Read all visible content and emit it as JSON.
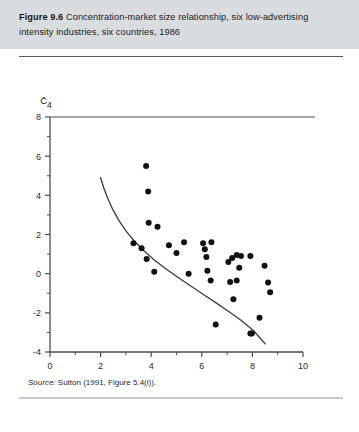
{
  "figure": {
    "label": "Figure 9.6",
    "title_text": "Concentration-market size relationship, six low-advertising intensity industries, six countries, 1986",
    "source_prefix": "Source:",
    "source_text": " Sutton (1991, Figure 5.4(i)).",
    "background": "#ffffff",
    "header_band_color": "#d9dcdf",
    "rule_color": "#55595d"
  },
  "chart_data": {
    "type": "scatter",
    "title": "Concentration-market size relationship, six low-advertising intensity industries, six countries, 1986",
    "subtitle": "",
    "xlabel": "ln(S/σ)",
    "ylabel": "C̄₄",
    "xlim": [
      0,
      10
    ],
    "ylim": [
      -4,
      8
    ],
    "xticks": [
      0,
      2,
      4,
      6,
      8,
      10
    ],
    "xticklabels": [
      "0",
      "2",
      "4",
      "6",
      "8",
      "10"
    ],
    "xminorticks": [
      1,
      3,
      5,
      7,
      9
    ],
    "yticks": [
      -4,
      -2,
      0,
      2,
      4,
      6,
      8
    ],
    "yticklabels": [
      "-4",
      "-2",
      "0",
      "2",
      "4",
      "6",
      "8"
    ],
    "yminorticks": [
      -3,
      -1,
      1,
      3,
      5,
      7
    ],
    "grid": false,
    "legend": "none",
    "marker_color": "#111111",
    "marker_size": 3.0,
    "curve_color": "#3c3f42",
    "points": [
      [
        3.8,
        5.5
      ],
      [
        3.88,
        4.2
      ],
      [
        3.9,
        2.6
      ],
      [
        4.25,
        2.4
      ],
      [
        3.3,
        1.55
      ],
      [
        3.62,
        1.3
      ],
      [
        3.82,
        0.75
      ],
      [
        4.12,
        0.1
      ],
      [
        4.7,
        1.45
      ],
      [
        5.3,
        1.6
      ],
      [
        6.05,
        1.55
      ],
      [
        6.12,
        1.25
      ],
      [
        6.38,
        1.6
      ],
      [
        6.18,
        0.85
      ],
      [
        5.0,
        1.05
      ],
      [
        5.48,
        0.0
      ],
      [
        6.22,
        0.15
      ],
      [
        6.35,
        -0.35
      ],
      [
        7.05,
        0.6
      ],
      [
        7.2,
        0.8
      ],
      [
        7.38,
        0.95
      ],
      [
        7.55,
        0.9
      ],
      [
        7.92,
        0.9
      ],
      [
        7.48,
        0.3
      ],
      [
        7.38,
        -0.35
      ],
      [
        7.12,
        -0.42
      ],
      [
        8.48,
        0.4
      ],
      [
        8.62,
        -0.45
      ],
      [
        8.7,
        -0.95
      ],
      [
        7.25,
        -1.3
      ],
      [
        6.55,
        -2.6
      ],
      [
        7.92,
        -3.05
      ],
      [
        7.98,
        -3.05
      ],
      [
        8.28,
        -2.25
      ]
    ],
    "curve": {
      "description": "lower-bound envelope curve",
      "points": [
        [
          2.0,
          4.9
        ],
        [
          2.12,
          4.4
        ],
        [
          2.28,
          3.85
        ],
        [
          2.48,
          3.28
        ],
        [
          2.72,
          2.72
        ],
        [
          3.0,
          2.18
        ],
        [
          3.32,
          1.68
        ],
        [
          3.7,
          1.18
        ],
        [
          4.1,
          0.72
        ],
        [
          4.55,
          0.28
        ],
        [
          5.05,
          -0.18
        ],
        [
          5.55,
          -0.62
        ],
        [
          6.05,
          -1.05
        ],
        [
          6.55,
          -1.48
        ],
        [
          7.05,
          -1.92
        ],
        [
          7.55,
          -2.38
        ],
        [
          8.05,
          -2.92
        ],
        [
          8.5,
          -3.58
        ]
      ]
    }
  }
}
